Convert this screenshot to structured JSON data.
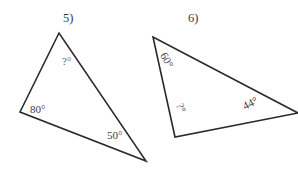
{
  "page": {
    "background_color": "#ffffff",
    "ink_color": "#2b2b2e",
    "text_color": "#3d3d42"
  },
  "figures": [
    {
      "number_label": "5)",
      "name": "triangle-5",
      "vertices": [
        [
          59,
          33
        ],
        [
          20,
          112
        ],
        [
          146,
          161
        ]
      ],
      "angles": [
        {
          "name": "unknown-angle",
          "text": "?°",
          "x": 62,
          "y": 65,
          "rotation": 0
        },
        {
          "name": "angle-80",
          "text": "80°",
          "x": 30,
          "y": 113,
          "rotation": 0
        },
        {
          "name": "angle-50",
          "text": "50°",
          "x": 107,
          "y": 139,
          "rotation": 0
        }
      ]
    },
    {
      "number_label": "6)",
      "name": "triangle-6",
      "vertices": [
        [
          153,
          37
        ],
        [
          175,
          137
        ],
        [
          298,
          113
        ]
      ],
      "angles": [
        {
          "name": "angle-60",
          "text": "60°",
          "x": 160,
          "y": 55,
          "rotation": 62
        },
        {
          "name": "unknown-angle",
          "text": "?°",
          "x": 176,
          "y": 105,
          "rotation": 68
        },
        {
          "name": "angle-44",
          "text": "44°",
          "x": 245,
          "y": 110,
          "rotation": -27
        }
      ]
    }
  ],
  "figure_numbers": [
    {
      "text": "5)",
      "x": 63,
      "y": 22
    },
    {
      "text": "6)",
      "x": 188,
      "y": 22
    }
  ]
}
